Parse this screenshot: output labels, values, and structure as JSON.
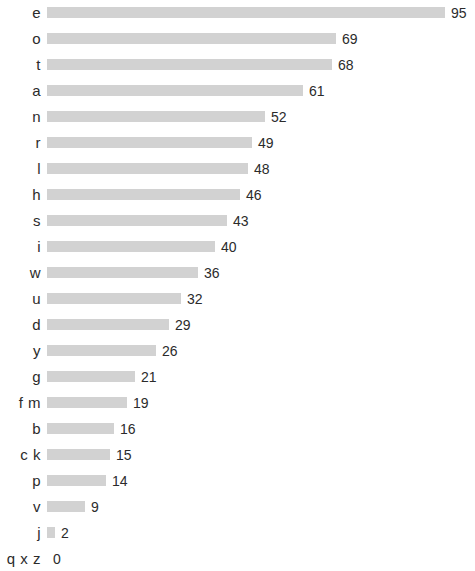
{
  "chart_data": {
    "type": "bar",
    "orientation": "horizontal",
    "title": "",
    "subtitle": "",
    "xlabel": "",
    "ylabel": "",
    "grid": false,
    "legend": null,
    "xlim": [
      0,
      95
    ],
    "categories": [
      "e",
      "o",
      "t",
      "a",
      "n",
      "r",
      "l",
      "h",
      "s",
      "i",
      "w",
      "u",
      "d",
      "y",
      "g",
      "f m",
      "b",
      "c k",
      "p",
      "v",
      "j",
      "q x z"
    ],
    "values": [
      95,
      69,
      68,
      61,
      52,
      49,
      48,
      46,
      43,
      40,
      36,
      32,
      29,
      26,
      21,
      19,
      16,
      15,
      14,
      9,
      2,
      0
    ],
    "value_labels": [
      "95",
      "69",
      "68",
      "61",
      "52",
      "49",
      "48",
      "46",
      "43",
      "40",
      "36",
      "32",
      "29",
      "26",
      "21",
      "19",
      "16",
      "15",
      "14",
      "9",
      "2",
      "0"
    ],
    "bar_color": "#d2d2d2",
    "text_color": "#2b2b2b",
    "background_color": "#ffffff"
  },
  "layout": {
    "row_height": 26,
    "bar_height": 11,
    "bar_origin_x": 47,
    "px_per_unit": 4.19,
    "first_row_top": 0
  }
}
